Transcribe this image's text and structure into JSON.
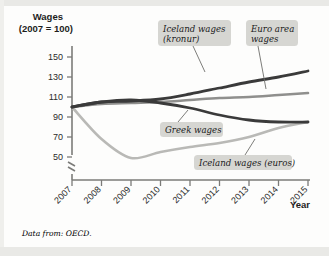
{
  "figure": {
    "source_note": "Data from: OECD."
  },
  "chart_data": {
    "type": "line",
    "title": "",
    "ylabel_line1": "Wages",
    "ylabel_line2": "(2007 = 100)",
    "xlabel": "Year",
    "x": [
      2007,
      2008,
      2009,
      2010,
      2011,
      2012,
      2013,
      2014,
      2015
    ],
    "xticklabels": [
      "2007",
      "2008",
      "2009",
      "2010",
      "2011",
      "2012",
      "2013",
      "2014",
      "2015"
    ],
    "yticks": [
      50,
      70,
      90,
      110,
      130,
      150
    ],
    "yticklabels": [
      "50",
      "70",
      "90",
      "110",
      "130",
      "150"
    ],
    "ylim": [
      42,
      155
    ],
    "y_axis_break": true,
    "grid": false,
    "legend": "callout-labels",
    "series": [
      {
        "name": "Iceland wages (kronur)",
        "color": "#3a3a3a",
        "width": 2.8,
        "values": [
          100,
          105,
          106,
          108,
          113,
          119,
          125,
          130,
          136
        ]
      },
      {
        "name": "Euro area wages",
        "color": "#8f8f8d",
        "width": 2.6,
        "values": [
          100,
          103,
          104,
          105,
          107,
          109,
          110,
          112,
          114
        ]
      },
      {
        "name": "Greek wages",
        "color": "#3a3a3a",
        "width": 2.8,
        "values": [
          100,
          105,
          107,
          104,
          99,
          92,
          87,
          85,
          85
        ]
      },
      {
        "name": "Iceland wages (euros)",
        "color": "#b9b9b6",
        "width": 2.6,
        "values": [
          100,
          68,
          49,
          55,
          60,
          64,
          70,
          79,
          85
        ]
      }
    ],
    "annotations": [
      {
        "name": "iceland-kronur",
        "text_line1": "Iceland wages",
        "text_line2": "(kronur)",
        "box": {
          "x": 158,
          "y": 20,
          "w": 73,
          "h": 26
        },
        "leader": {
          "x1": 193,
          "y1": 46,
          "x2": 205,
          "y2": 72
        }
      },
      {
        "name": "euro-area",
        "text_line1": "Euro area",
        "text_line2": "wages",
        "box": {
          "x": 246,
          "y": 20,
          "w": 52,
          "h": 26
        },
        "leader": {
          "x1": 258,
          "y1": 46,
          "x2": 266,
          "y2": 89
        }
      },
      {
        "name": "greek",
        "text_line1": "Greek wages",
        "text_line2": "",
        "box": {
          "x": 160,
          "y": 122,
          "w": 63,
          "h": 15
        },
        "leader": {
          "x1": 178,
          "y1": 122,
          "x2": 188,
          "y2": 110
        }
      },
      {
        "name": "iceland-euros",
        "text_line1": "Iceland wages  (euros)",
        "text_line2": "",
        "box": {
          "x": 194,
          "y": 155,
          "w": 98,
          "h": 15
        },
        "leader": {
          "x1": 245,
          "y1": 155,
          "x2": 255,
          "y2": 139
        }
      }
    ]
  }
}
